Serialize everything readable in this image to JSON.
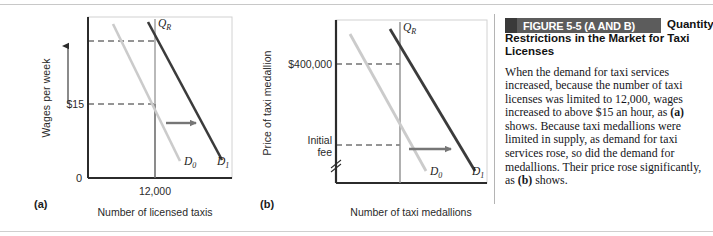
{
  "figure": {
    "band_label": "FIGURE 5-5 (A AND B)",
    "title": "Quantity Restrictions in the Market for Taxi Licenses",
    "body": "When the demand for taxi services increased, because the number of taxi licenses was limited to 12,000, wages increased to above $15 an hour, as (a) shows. Because taxi medallions were limited in supply, as demand for taxi services rose, so did the demand for medallions. Their price rose significantly, as (b) shows.",
    "band_color": "#5c5c5c",
    "band_square_color": "#3a3a3a"
  },
  "panels": {
    "a": {
      "tag": "(a)",
      "ylabel": "Wages per week",
      "xlabel": "Number of licensed taxis",
      "origin_label": "0",
      "yticks": [
        "$15"
      ],
      "xticks": [
        "12,000"
      ],
      "restriction_label": "Q",
      "restriction_sub": "R",
      "curve0_label": "D",
      "curve0_sub": "0",
      "curve1_label": "D",
      "curve1_sub": "1"
    },
    "b": {
      "tag": "(b)",
      "ylabel": "Price of taxi medallion",
      "xlabel": "Number of taxi medallions",
      "yticks": [
        "$400,000",
        "Initial",
        "fee"
      ],
      "restriction_label": "Q",
      "restriction_sub": "R",
      "curve0_label": "D",
      "curve0_sub": "0",
      "curve1_label": "D",
      "curve1_sub": "1"
    }
  },
  "chart_data": [
    {
      "type": "line",
      "panel": "a",
      "title": "Quantity Restrictions in the Market for Taxi Licenses (a)",
      "xlabel": "Number of licensed taxis",
      "ylabel": "Wages per week",
      "series": [
        {
          "name": "D0",
          "color": "#c9c9c9",
          "points": [
            [
              0.18,
              0.95
            ],
            [
              0.62,
              0.12
            ]
          ]
        },
        {
          "name": "D1",
          "color": "#3a3a3a",
          "points": [
            [
              0.42,
              0.97
            ],
            [
              0.92,
              0.14
            ]
          ]
        },
        {
          "name": "QR",
          "color": "#8c8c8c",
          "points": [
            [
              0.52,
              1.0
            ],
            [
              0.52,
              0.0
            ]
          ]
        }
      ],
      "annotations": [
        {
          "text": "QR",
          "note": "vertical quantity restriction at 12,000 licenses"
        },
        {
          "text": "$15",
          "note": "wage where D0 crosses the restriction"
        },
        {
          "text": "upward arrow",
          "note": "wage rises from $15 to the higher dashed level"
        },
        {
          "text": "rightward arrow",
          "note": "demand shifts right from D0 to D1"
        }
      ],
      "xticks": [
        "12,000"
      ],
      "yticks": [
        "$15"
      ],
      "grid": false,
      "legend": "inline-curve-labels"
    },
    {
      "type": "line",
      "panel": "b",
      "title": "Quantity Restrictions in the Market for Taxi Licenses (b)",
      "xlabel": "Number of taxi medallions",
      "ylabel": "Price of taxi medallion",
      "series": [
        {
          "name": "D0",
          "color": "#c9c9c9",
          "points": [
            [
              0.12,
              0.92
            ],
            [
              0.58,
              0.08
            ]
          ]
        },
        {
          "name": "D1",
          "color": "#3a3a3a",
          "points": [
            [
              0.4,
              0.95
            ],
            [
              0.88,
              0.1
            ]
          ]
        },
        {
          "name": "QR",
          "color": "#8c8c8c",
          "points": [
            [
              0.52,
              1.0
            ],
            [
              0.52,
              0.0
            ]
          ]
        }
      ],
      "annotations": [
        {
          "text": "QR",
          "note": "vertical quantity restriction on medallions"
        },
        {
          "text": "$400,000",
          "note": "medallion price where D1 crosses the restriction"
        },
        {
          "text": "Initial fee",
          "note": "medallion price where D0 crosses the restriction"
        },
        {
          "text": "rightward arrow",
          "note": "demand shifts right from D0 to D1"
        },
        {
          "text": "axis break",
          "note": "scale break on the price axis below Initial fee"
        }
      ],
      "yticks": [
        "$400,000",
        "Initial fee"
      ],
      "grid": false,
      "legend": "inline-curve-labels"
    }
  ]
}
